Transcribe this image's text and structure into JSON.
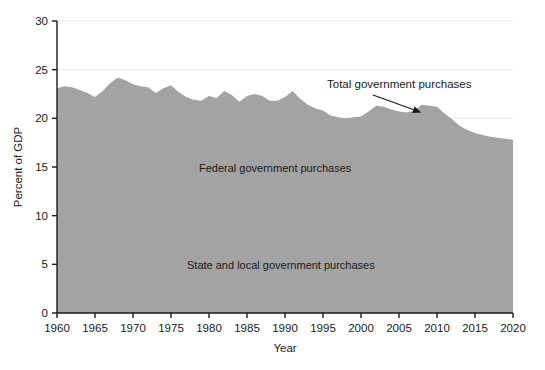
{
  "chart_data": {
    "type": "area",
    "title": "",
    "xlabel": "Year",
    "ylabel": "Percent of GDP",
    "xlim": [
      1960,
      2020
    ],
    "ylim": [
      0,
      30
    ],
    "grid": true,
    "grid_axis": "y",
    "legend_position": "inside-annotations",
    "xticks": [
      1960,
      1965,
      1970,
      1975,
      1980,
      1985,
      1990,
      1995,
      2000,
      2005,
      2010,
      2015,
      2020
    ],
    "xtick_labels": [
      "1960",
      "1965",
      "1970",
      "1975",
      "1980",
      "1985",
      "1990",
      "1995",
      "2000",
      "2005",
      "2010",
      "2015",
      "2020"
    ],
    "yticks": [
      0,
      5,
      10,
      15,
      20,
      25,
      30
    ],
    "ytick_labels": [
      "0",
      "5",
      "10",
      "15",
      "20",
      "25",
      "30"
    ],
    "series": [
      {
        "name": "Total government purchases",
        "fill_color": "#a3a3a3",
        "x": [
          1960,
          1961,
          1962,
          1963,
          1964,
          1965,
          1966,
          1967,
          1968,
          1969,
          1970,
          1971,
          1972,
          1973,
          1974,
          1975,
          1976,
          1977,
          1978,
          1979,
          1980,
          1981,
          1982,
          1983,
          1984,
          1985,
          1986,
          1987,
          1988,
          1989,
          1990,
          1991,
          1992,
          1993,
          1994,
          1995,
          1996,
          1997,
          1998,
          1999,
          2000,
          2001,
          2002,
          2003,
          2004,
          2005,
          2006,
          2007,
          2008,
          2009,
          2010,
          2011,
          2012,
          2013,
          2014,
          2015,
          2016,
          2017,
          2018,
          2019,
          2020
        ],
        "values": [
          23.1,
          23.3,
          23.2,
          22.9,
          22.6,
          22.2,
          22.8,
          23.6,
          24.2,
          23.9,
          23.5,
          23.3,
          23.2,
          22.6,
          23.1,
          23.4,
          22.7,
          22.2,
          21.9,
          21.8,
          22.3,
          22.1,
          22.8,
          22.4,
          21.7,
          22.3,
          22.5,
          22.3,
          21.8,
          21.8,
          22.2,
          22.8,
          22.0,
          21.4,
          21.0,
          20.8,
          20.3,
          20.1,
          20.0,
          20.1,
          20.2,
          20.7,
          21.3,
          21.2,
          20.9,
          20.7,
          20.6,
          20.8,
          21.4,
          21.3,
          21.2,
          20.5,
          19.9,
          19.2,
          18.8,
          18.5,
          18.3,
          18.1,
          18.0,
          17.9,
          17.8
        ]
      }
    ],
    "annotations": [
      {
        "text": "Total government purchases",
        "x_px": 327,
        "y_px": 88,
        "arrow_from_x_px": 373,
        "arrow_from_y_px": 95,
        "arrow_to_x_px": 420,
        "arrow_to_y_px": 112
      },
      {
        "text": "Federal government purchases",
        "x_px": 199,
        "y_px": 172
      },
      {
        "text": "State and local government purchases",
        "x_px": 187,
        "y_px": 269
      }
    ],
    "colors": {
      "area_fill": "#a3a3a3",
      "axis": "#1a1a1a",
      "gridline": "#e8e8e8",
      "background": "#ffffff",
      "text": "#1a1a1a"
    }
  }
}
